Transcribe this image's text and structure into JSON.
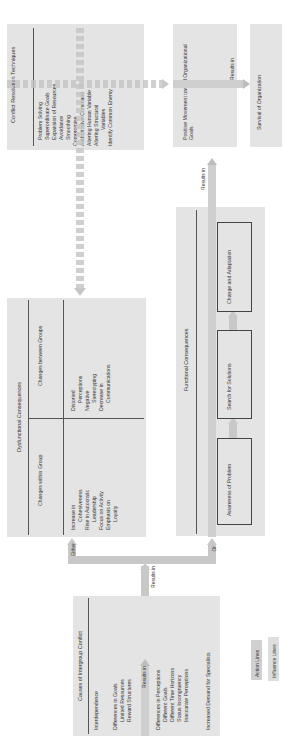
{
  "causes": {
    "title": "Causes of Intergroup Conflict",
    "items": [
      "Interdependence",
      "Differences in Goals",
      "Limited Resources",
      "Reward Structures",
      "Differences in Perceptions",
      "Different Goals",
      "Different Time Horizons",
      "Status Incongruency",
      "Inaccurate Perceptions",
      "Increased Demand for Specialists"
    ]
  },
  "intergroup": {
    "title": "Intergroup Conflict"
  },
  "labels": {
    "results_in": "Results in",
    "either": "Either",
    "or": "Or"
  },
  "dysfunctional": {
    "title": "Dysfunctional Consequences",
    "col1_title": "Changes within Group",
    "col2_title": "Changes between Groups",
    "col1_items": [
      "Increase in",
      "Cohesiveness",
      "Rise in Autocratic",
      "Leadership",
      "Focus on Activity",
      "Emphasis on",
      "Loyalty"
    ],
    "col2_items": [
      "Distorted",
      "Perceptions",
      "Negative",
      "Stereotyping",
      "Decrease in",
      "Communications"
    ]
  },
  "functional": {
    "title": "Functional Consequences",
    "steps": [
      "Awareness of Problem",
      "Search for Solutions",
      "Change and Adaptation"
    ]
  },
  "resolution": {
    "title": "Conflict Resolution Techniques",
    "items": [
      "Problem Solving",
      "Superordinate Goals",
      "Expansion of Resources",
      "Avoidance",
      "Smoothing",
      "Compromise",
      "Authoritative Command",
      "Altering Human Variable",
      "Altering Structural",
      "Variables",
      "Identify Common Enemy"
    ]
  },
  "positive": {
    "title": "Positive Movement toward Organizational Goals"
  },
  "survival": {
    "title": "Survival of Organization"
  },
  "legend": {
    "action": "Action Lines",
    "influence": "Influence Lines"
  }
}
